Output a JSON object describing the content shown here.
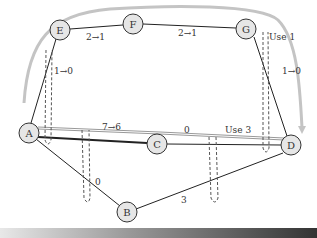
{
  "diagram": {
    "type": "flow-network",
    "nodes": [
      {
        "id": "A",
        "label": "A",
        "x": 29,
        "y": 133
      },
      {
        "id": "B",
        "label": "B",
        "x": 127,
        "y": 212
      },
      {
        "id": "C",
        "label": "C",
        "x": 157,
        "y": 144
      },
      {
        "id": "D",
        "label": "D",
        "x": 291,
        "y": 145
      },
      {
        "id": "E",
        "label": "E",
        "x": 60,
        "y": 30
      },
      {
        "id": "F",
        "label": "F",
        "x": 133,
        "y": 24
      },
      {
        "id": "G",
        "label": "G",
        "x": 246,
        "y": 29
      }
    ],
    "edges": [
      {
        "from": "E",
        "to": "F",
        "label": "2→1"
      },
      {
        "from": "F",
        "to": "G",
        "label": "2→1"
      },
      {
        "from": "A",
        "to": "E",
        "label": "1→0"
      },
      {
        "from": "G",
        "to": "D",
        "label": "1→0"
      },
      {
        "from": "A",
        "to": "C",
        "label": "7→6"
      },
      {
        "from": "C",
        "to": "D",
        "label": "0"
      },
      {
        "from": "A",
        "to": "B",
        "label": "0"
      },
      {
        "from": "B",
        "to": "D",
        "label": "3"
      }
    ],
    "annotations": [
      {
        "text": "Use 1",
        "near": "G"
      },
      {
        "text": "Use 3",
        "near": "C-D"
      }
    ],
    "labels": {
      "ef": "2→1",
      "fg": "2→1",
      "ae": "1→0",
      "gd": "1→0",
      "ac": "7→6",
      "cd": "0",
      "ab": "0",
      "bd": "3",
      "use1": "Use 1",
      "use3": "Use 3"
    },
    "colors": {
      "node_fill": "#e6e6e6",
      "edge": "#222222",
      "path_highlight": "#bdbdbd",
      "cut_dashed": "#555555"
    }
  }
}
